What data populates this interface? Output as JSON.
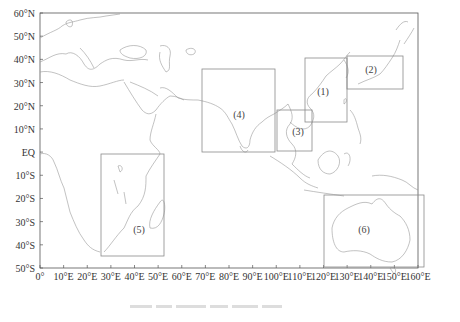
{
  "chart_data": {
    "type": "map",
    "projection": "equirectangular",
    "extent": {
      "lon": [
        0,
        160
      ],
      "lat": [
        -50,
        60
      ]
    },
    "y_ticks": [
      "60°N",
      "50°N",
      "40°N",
      "30°N",
      "20°N",
      "10°N",
      "EQ",
      "10°S",
      "20°S",
      "30°S",
      "40°S",
      "50°S"
    ],
    "y_tick_values": [
      60,
      50,
      40,
      30,
      20,
      10,
      0,
      -10,
      -20,
      -30,
      -40,
      -50
    ],
    "x_ticks": [
      "0°",
      "10°E",
      "20°E",
      "30°E",
      "40°E",
      "50°E",
      "60°E",
      "70°E",
      "80°E",
      "90°E",
      "100°E",
      "110°E",
      "120°E",
      "130°E",
      "140°E",
      "150°E",
      "160°E"
    ],
    "x_tick_values": [
      0,
      10,
      20,
      30,
      40,
      50,
      60,
      70,
      80,
      90,
      100,
      110,
      120,
      130,
      140,
      150,
      160
    ],
    "regions": [
      {
        "label": "(1)",
        "lon": [
          112,
          130
        ],
        "lat": [
          18,
          41
        ]
      },
      {
        "label": "(2)",
        "lon": [
          130,
          154
        ],
        "lat": [
          27,
          42
        ]
      },
      {
        "label": "(3)",
        "lon": [
          100,
          115
        ],
        "lat": [
          6,
          22
        ]
      },
      {
        "label": "(4)",
        "lon": [
          68,
          100
        ],
        "lat": [
          6,
          38
        ]
      },
      {
        "label": "(5)",
        "lon": [
          26,
          52
        ],
        "lat": [
          -35,
          8
        ]
      },
      {
        "label": "(6)",
        "lon": [
          120,
          155
        ],
        "lat": [
          -38,
          -10
        ]
      }
    ],
    "grid": false,
    "coastline_color": "#8a8a8a",
    "box_color": "#8a8a8a"
  },
  "caption": {
    "visible_text": ""
  }
}
